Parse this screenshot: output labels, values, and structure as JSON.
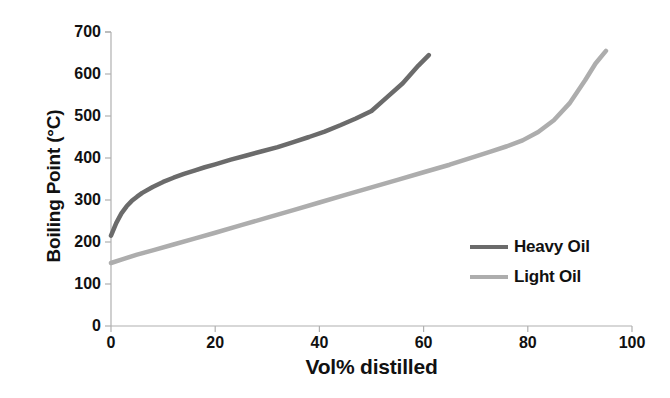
{
  "chart_data": {
    "type": "line",
    "title": "",
    "xlabel": "Vol% distilled",
    "ylabel": "Boiling Point (°C)",
    "xlim": [
      0,
      100
    ],
    "ylim": [
      0,
      700
    ],
    "xticks": [
      0,
      20,
      40,
      60,
      80,
      100
    ],
    "xtick_labels": [
      "0",
      "20",
      "40",
      "60",
      "80",
      "100"
    ],
    "yticks": [
      0,
      100,
      200,
      300,
      400,
      500,
      600,
      700
    ],
    "ytick_labels": [
      "0",
      "100",
      "200",
      "300",
      "400",
      "500",
      "600",
      "700"
    ],
    "grid": false,
    "legend_position": "center-right",
    "series": [
      {
        "name": "Heavy Oil",
        "color": "#6b6b6b",
        "x": [
          0,
          1,
          2,
          3,
          4,
          5,
          6,
          8,
          10,
          12,
          14,
          16,
          18,
          20,
          23,
          26,
          29,
          32,
          35,
          38,
          41,
          44,
          47,
          50,
          53,
          56,
          59,
          61
        ],
        "y": [
          215,
          245,
          268,
          285,
          298,
          308,
          317,
          331,
          343,
          353,
          362,
          370,
          378,
          385,
          396,
          406,
          416,
          426,
          438,
          450,
          463,
          478,
          494,
          512,
          545,
          578,
          620,
          645
        ]
      },
      {
        "name": "Light Oil",
        "color": "#adadad",
        "x": [
          0,
          2,
          5,
          8,
          12,
          16,
          20,
          25,
          30,
          35,
          40,
          45,
          50,
          55,
          60,
          65,
          70,
          73,
          76,
          79,
          82,
          85,
          88,
          91,
          93,
          95
        ],
        "y": [
          150,
          158,
          170,
          180,
          194,
          208,
          222,
          240,
          258,
          276,
          294,
          312,
          330,
          348,
          366,
          384,
          404,
          416,
          428,
          442,
          462,
          490,
          530,
          585,
          625,
          655
        ]
      }
    ]
  },
  "legend": {
    "entries": [
      {
        "label": "Heavy Oil"
      },
      {
        "label": "Light Oil"
      }
    ]
  },
  "axis": {
    "color": "#b0b0b0"
  }
}
